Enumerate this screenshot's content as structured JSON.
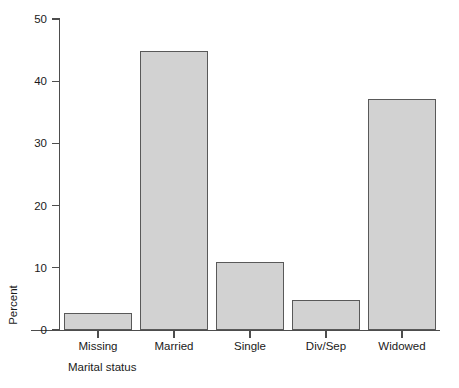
{
  "chart_data": {
    "type": "bar",
    "title": "",
    "subtitle": "",
    "categories": [
      "Missing",
      "Married",
      "Single",
      "Div/Sep",
      "Widowed"
    ],
    "values": [
      2.7,
      44.8,
      11.0,
      4.9,
      37.2
    ],
    "xlabel": "Marital status",
    "ylabel": "Percent",
    "ylim": [
      0,
      50
    ],
    "yticks": [
      0,
      10,
      20,
      30,
      40,
      50
    ],
    "ytick_labels": [
      "0",
      "10",
      "20",
      "30",
      "40",
      "50"
    ],
    "grid": false,
    "legend": null,
    "legend_position": "none",
    "bar_fill_color": "#d2d2d2",
    "bar_edge_color": "#595959",
    "axis_color": "#4d4d4d",
    "text_color": "#1a1a1a",
    "background_color": "#ffffff"
  },
  "axes": {
    "y_title": "Percent",
    "x_title": "Marital status"
  }
}
